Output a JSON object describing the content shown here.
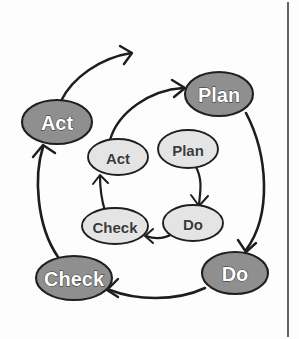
{
  "figure": {
    "background_color": "#fdfdfd",
    "width": 299,
    "height": 339
  },
  "style": {
    "outer_fill": "#8f8f8f",
    "inner_fill": "#e4e4e4",
    "outline_color": "#1f1f1f",
    "outer_text_color": "#ffffff",
    "inner_text_color": "#3a3a3a",
    "arrow_color": "#1d1d1d",
    "rule_color": "#3b3b3b"
  },
  "cycles": {
    "outer": {
      "name": "outer-pdca-cycle",
      "nodes": [
        {
          "id": "outer-plan",
          "label": "Plan",
          "cx": 219,
          "cy": 94,
          "rx": 34,
          "ry": 22,
          "font_size": 20
        },
        {
          "id": "outer-do",
          "label": "Do",
          "cx": 235,
          "cy": 273,
          "rx": 33,
          "ry": 21,
          "font_size": 20
        },
        {
          "id": "outer-check",
          "label": "Check",
          "cx": 74,
          "cy": 278,
          "rx": 38,
          "ry": 22,
          "font_size": 20
        },
        {
          "id": "outer-act",
          "label": "Act",
          "cx": 57,
          "cy": 122,
          "rx": 35,
          "ry": 22,
          "font_size": 20
        }
      ]
    },
    "inner": {
      "name": "inner-pdca-cycle",
      "nodes": [
        {
          "id": "inner-plan",
          "label": "Plan",
          "cx": 188,
          "cy": 149,
          "rx": 30,
          "ry": 19,
          "font_size": 15
        },
        {
          "id": "inner-do",
          "label": "Do",
          "cx": 193,
          "cy": 223,
          "rx": 30,
          "ry": 18,
          "font_size": 15
        },
        {
          "id": "inner-check",
          "label": "Check",
          "cx": 115,
          "cy": 226,
          "rx": 33,
          "ry": 18,
          "font_size": 15
        },
        {
          "id": "inner-act",
          "label": "Act",
          "cx": 118,
          "cy": 157,
          "rx": 30,
          "ry": 18,
          "font_size": 15
        }
      ]
    }
  },
  "arrows": {
    "outer_plan_to_do": {
      "name": "arrow-outer-plan-to-do",
      "d": "M 246 113 C 268 155, 272 215, 246 250",
      "width": 2.6
    },
    "outer_do_to_check": {
      "name": "arrow-outer-do-to-check",
      "d": "M 205 288 C 175 302, 135 300, 110 290",
      "width": 2.6
    },
    "outer_check_to_act": {
      "name": "arrow-outer-check-to-act",
      "d": "M 58 257 C 36 225, 34 175, 43 147",
      "width": 2.6
    },
    "inner_act_to_outer_plan": {
      "name": "arrow-inner-act-to-outer-plan",
      "d": "M 110 140 C 118 112, 150 90, 183 88",
      "width": 2.4
    },
    "outer_act_to_exit": {
      "name": "arrow-outer-act-spiral-exit",
      "d": "M 61 101 C 72 78, 100 58, 131 53",
      "width": 2.4
    },
    "inner_plan_to_do": {
      "name": "arrow-inner-plan-to-do",
      "d": "M 196 167 C 203 180, 200 193, 199 205",
      "width": 2.2
    },
    "inner_do_to_check": {
      "name": "arrow-inner-do-to-check",
      "d": "M 172 234 C 162 240, 154 239, 146 236",
      "width": 2.2
    },
    "inner_check_to_act": {
      "name": "arrow-inner-check-to-act",
      "d": "M 105 211 C 101 198, 100 186, 100 176",
      "width": 2.2
    }
  },
  "arrow_heads": {
    "outer_plan_to_do": {
      "name": "arrowhead-outer-do",
      "d": "M 238 240 L 246 252 L 256 243"
    },
    "outer_do_to_check": {
      "name": "arrowhead-outer-check",
      "d": "M 118 279 L 107 290 L 118 297"
    },
    "outer_check_to_act": {
      "name": "arrowhead-outer-act",
      "d": "M 33 157 L 43 145 L 55 153"
    },
    "inner_act_to_outer_plan": {
      "name": "arrowhead-outer-plan",
      "d": "M 172 80 L 185 88 L 174 97"
    },
    "outer_act_to_exit": {
      "name": "arrowhead-spiral-exit",
      "d": "M 120 46 L 132 53 L 124 64"
    },
    "inner_plan_to_do": {
      "name": "arrowhead-inner-do",
      "d": "M 191 195 L 199 206 L 208 196"
    },
    "inner_do_to_check": {
      "name": "arrowhead-inner-check",
      "d": "M 153 229 L 145 236 L 153 243"
    },
    "inner_check_to_act": {
      "name": "arrowhead-inner-act",
      "d": "M 93 184 L 100 175 L 108 183"
    }
  },
  "page_rule": {
    "name": "page-margin-rule",
    "x": 288,
    "y1": 2,
    "y2": 337
  }
}
